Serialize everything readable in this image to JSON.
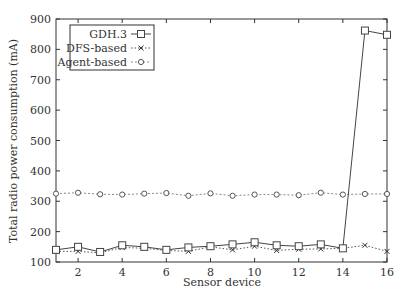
{
  "chart_data": {
    "type": "line",
    "title": "",
    "xlabel": "Sensor device",
    "ylabel": "Total radio power consumption (mA)",
    "xlim": [
      1,
      16
    ],
    "ylim": [
      100,
      900
    ],
    "xticks": [
      2,
      4,
      6,
      8,
      10,
      12,
      14,
      16
    ],
    "yticks": [
      100,
      200,
      300,
      400,
      500,
      600,
      700,
      800,
      900
    ],
    "grid": false,
    "legend_position": "upper left",
    "x": [
      1,
      2,
      3,
      4,
      5,
      6,
      7,
      8,
      9,
      10,
      11,
      12,
      13,
      14,
      15,
      16
    ],
    "series": [
      {
        "name": "GDH.3",
        "marker": "square",
        "line": "solid",
        "values": [
          140,
          150,
          133,
          155,
          150,
          140,
          148,
          152,
          158,
          165,
          155,
          152,
          158,
          145,
          862,
          848
        ]
      },
      {
        "name": "DFS-based",
        "marker": "x",
        "line": "dotted",
        "values": [
          135,
          135,
          130,
          148,
          145,
          138,
          135,
          150,
          140,
          152,
          138,
          142,
          143,
          145,
          155,
          135
        ]
      },
      {
        "name": "Agent-based",
        "marker": "circle",
        "line": "dashed",
        "values": [
          325,
          328,
          323,
          322,
          325,
          327,
          318,
          326,
          318,
          322,
          322,
          320,
          328,
          322,
          324,
          324
        ]
      }
    ]
  }
}
